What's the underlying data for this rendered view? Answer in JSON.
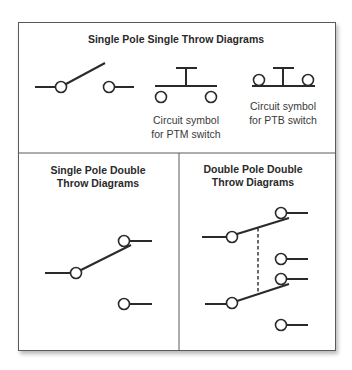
{
  "panels": {
    "spst": {
      "title": "Single Pole Single Throw Diagrams",
      "ptm_caption_line1": "Circuit symbol",
      "ptm_caption_line2": "for PTM switch",
      "ptb_caption_line1": "Circuit symbol",
      "ptb_caption_line2": "for PTB switch"
    },
    "spdt": {
      "title_line1": "Single Pole Double",
      "title_line2": "Throw Diagrams"
    },
    "dpdt": {
      "title_line1": "Double Pole Double",
      "title_line2": "Throw Diagrams"
    }
  },
  "colors": {
    "line": "#2a2a2a",
    "border": "#5a5a5a",
    "background": "#ffffff"
  }
}
